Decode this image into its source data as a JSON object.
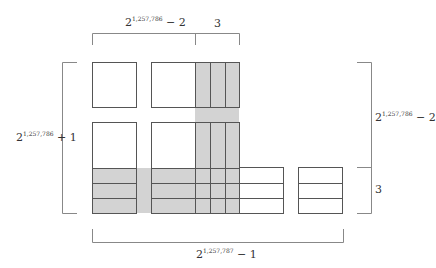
{
  "colors": {
    "shade": "#d3d3d3",
    "box_stroke": "#555555",
    "bracket_stroke": "#888888",
    "text": "#333333"
  },
  "labels": {
    "top_left": {
      "base": "2",
      "exp": "1,257,786",
      "tail": " − 2"
    },
    "top_right": {
      "text": "3"
    },
    "left": {
      "base": "2",
      "exp": "1,257,786",
      "tail": " + 1"
    },
    "right_upper": {
      "base": "2",
      "exp": "1,257,786",
      "tail": " − 2"
    },
    "right_lower": {
      "text": "3"
    },
    "bottom": {
      "base": "2",
      "exp": "1,257,787",
      "tail": " − 1"
    }
  }
}
